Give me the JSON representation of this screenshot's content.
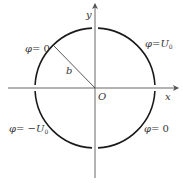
{
  "diagram": {
    "type": "circle-boundary-potentials",
    "colors": {
      "circle": "#1a1a1a",
      "axes": "#555555",
      "radius": "#444444",
      "text": "#333333"
    },
    "axes": {
      "x_label": "x",
      "y_label": "y",
      "origin_label": "O"
    },
    "radius_label": "b",
    "quadrant_labels": {
      "upper_left": {
        "phi": "φ",
        "eq": "= ",
        "value": "0",
        "sub": ""
      },
      "upper_right": {
        "phi": "φ",
        "eq": "=",
        "value": "U",
        "sub": "0"
      },
      "lower_left": {
        "phi": "φ",
        "eq": "= −",
        "value": "U",
        "sub": "0"
      },
      "lower_right": {
        "phi": "φ",
        "eq": "= ",
        "value": "0",
        "sub": ""
      }
    },
    "geometry": {
      "center": [
        95,
        88
      ],
      "radius": 60
    }
  }
}
